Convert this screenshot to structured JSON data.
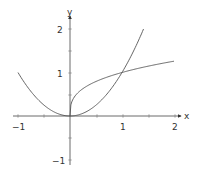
{
  "chart_data": {
    "type": "line",
    "title": "",
    "xlabel": "x",
    "ylabel": "y",
    "xlim": [
      -1,
      2
    ],
    "ylim": [
      -1,
      2
    ],
    "grid": false,
    "legend": null,
    "x_ticks": [
      -1,
      1,
      2
    ],
    "y_ticks": [
      -1,
      1,
      2
    ],
    "x_tick_labels": [
      "−1",
      "1",
      "2"
    ],
    "y_tick_labels": [
      "−1",
      "1",
      "2"
    ],
    "series": [
      {
        "name": "y = x^2",
        "domain": [
          -1,
          1.414
        ],
        "x": [
          -1,
          -0.75,
          -0.5,
          -0.25,
          0,
          0.25,
          0.5,
          0.75,
          1,
          1.25,
          1.414
        ],
        "values": [
          1,
          0.5625,
          0.25,
          0.0625,
          0,
          0.0625,
          0.25,
          0.5625,
          1,
          1.5625,
          2
        ]
      },
      {
        "name": "y = cbrt(x)",
        "domain": [
          0,
          2
        ],
        "x": [
          0,
          0.01,
          0.05,
          0.125,
          0.25,
          0.5,
          0.75,
          1,
          1.25,
          1.5,
          1.75,
          2
        ],
        "values": [
          0,
          0.215,
          0.368,
          0.5,
          0.63,
          0.794,
          0.909,
          1,
          1.077,
          1.145,
          1.205,
          1.26
        ]
      }
    ],
    "annotations": [
      "Curves intersect at (0,0) and (1,1)"
    ]
  },
  "axes": {
    "x_label": "x",
    "y_label": "y",
    "x_ticks": [
      {
        "value": -1,
        "label": "−1"
      },
      {
        "value": 1,
        "label": "1"
      },
      {
        "value": 2,
        "label": "2"
      }
    ],
    "y_ticks": [
      {
        "value": 2,
        "label": "2"
      },
      {
        "value": 1,
        "label": "1"
      },
      {
        "value": -1,
        "label": "−1"
      }
    ]
  }
}
